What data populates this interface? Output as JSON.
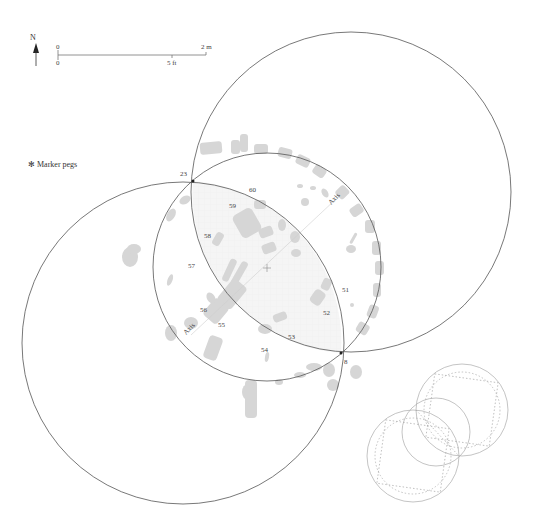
{
  "north_arrow": {
    "label": "N"
  },
  "scale_bar": {
    "top_start": "0",
    "top_end": "2 m",
    "bottom_start": "0",
    "bottom_mid": "5 ft"
  },
  "legend": {
    "marker_label": "Marker pegs"
  },
  "peg_labels": {
    "p23": "23",
    "p8": "8"
  },
  "stone_labels": [
    {
      "id": "60",
      "x": 254,
      "y": 190
    },
    {
      "id": "59",
      "x": 233,
      "y": 207
    },
    {
      "id": "58",
      "x": 208,
      "y": 238
    },
    {
      "id": "57",
      "x": 193,
      "y": 267
    },
    {
      "id": "56",
      "x": 204,
      "y": 310
    },
    {
      "id": "55",
      "x": 222,
      "y": 325
    },
    {
      "id": "54",
      "x": 265,
      "y": 352
    },
    {
      "id": "53",
      "x": 292,
      "y": 338
    },
    {
      "id": "52",
      "x": 327,
      "y": 314
    },
    {
      "id": "51",
      "x": 346,
      "y": 290
    }
  ],
  "axis_labels": {
    "upper": "Axis",
    "lower": "Axis"
  },
  "colors": {
    "line": "#555555",
    "stone": "#d6d6d6",
    "vesica_fill": "#f3f3f3",
    "inset_line": "#aaaaaa"
  }
}
